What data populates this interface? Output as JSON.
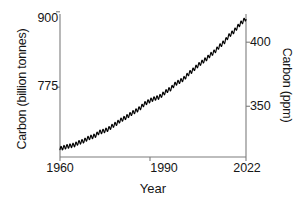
{
  "chart_data": {
    "type": "line",
    "title": "",
    "subtitle": "",
    "xlabel": "Year",
    "ylabel": "Carbon (billion tonnes)",
    "ylabel_right": "Carbon (ppm)",
    "xlim": [
      1960,
      2022
    ],
    "ylim_left": [
      710,
      900
    ],
    "ylim_right": [
      310.4,
      422.0
    ],
    "yticks_left": [
      775,
      900
    ],
    "yticks_left_labels": [
      "775",
      "900"
    ],
    "yticks_right": [
      350,
      400
    ],
    "yticks_right_labels": [
      "350",
      "400"
    ],
    "xticks": [
      1960,
      1990,
      2022
    ],
    "xticks_labels": [
      "1960",
      "1990",
      "2022"
    ],
    "grid": false,
    "legend": "none",
    "line_color": "#000000",
    "series": [
      {
        "name": "Atmospheric CO2 (Keeling Curve, monthly)",
        "annual_mean_ppm": [
          316.9,
          317.6,
          318.4,
          318.9,
          319.4,
          320.0,
          321.4,
          322.2,
          323.0,
          324.6,
          325.7,
          326.3,
          327.5,
          329.7,
          330.2,
          331.1,
          332.0,
          333.8,
          335.4,
          336.8,
          338.8,
          340.1,
          341.4,
          343.0,
          344.6,
          346.0,
          347.4,
          349.2,
          351.6,
          353.1,
          354.4,
          355.6,
          356.4,
          357.1,
          358.8,
          360.8,
          362.6,
          363.7,
          366.6,
          368.3,
          369.5,
          371.0,
          373.2,
          375.8,
          377.5,
          379.8,
          381.9,
          383.8,
          385.6,
          387.4,
          389.9,
          391.6,
          393.8,
          396.5,
          398.6,
          400.8,
          404.2,
          406.5,
          408.5,
          411.4,
          414.2,
          416.4,
          418.5
        ],
        "years": [
          1960,
          1961,
          1962,
          1963,
          1964,
          1965,
          1966,
          1967,
          1968,
          1969,
          1970,
          1971,
          1972,
          1973,
          1974,
          1975,
          1976,
          1977,
          1978,
          1979,
          1980,
          1981,
          1982,
          1983,
          1984,
          1985,
          1986,
          1987,
          1988,
          1989,
          1990,
          1991,
          1992,
          1993,
          1994,
          1995,
          1996,
          1997,
          1998,
          1999,
          2000,
          2001,
          2002,
          2003,
          2004,
          2005,
          2006,
          2007,
          2008,
          2009,
          2010,
          2011,
          2012,
          2013,
          2014,
          2015,
          2016,
          2017,
          2018,
          2019,
          2020,
          2021,
          2022
        ],
        "seasonal_amplitude_ppm": 3.1,
        "seasonal_peak_month": 5,
        "ppm_to_gigatonnes_factor": 2.124
      }
    ],
    "axis_note": "Left axis billion tonnes carbon, right axis ppm; the two scales are linearly proportional."
  },
  "axes": {
    "left": {
      "title": "Carbon (billion tonnes)",
      "tick_top_label": "900",
      "tick_bottom_label": "775"
    },
    "right": {
      "title": "Carbon (ppm)",
      "tick_top_label": "400",
      "tick_bottom_label": "350"
    },
    "bottom": {
      "title": "Year",
      "tick_start_label": "1960",
      "tick_mid_label": "1990",
      "tick_end_label": "2022"
    }
  }
}
